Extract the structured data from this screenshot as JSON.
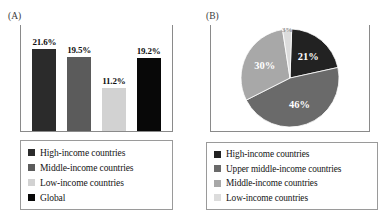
{
  "figure": {
    "panels": [
      {
        "tag": "(A)",
        "name": "bar-panel"
      },
      {
        "tag": "(B)",
        "name": "pie-panel"
      }
    ]
  },
  "chart_data": [
    {
      "type": "bar",
      "panel": "(A)",
      "title": "",
      "xlabel": "",
      "ylabel": "",
      "ylim": [
        0,
        25
      ],
      "grid": false,
      "legend_position": "below",
      "categories": [
        "High-income countries",
        "Middle-income countries",
        "Low-income countries",
        "Global"
      ],
      "values": [
        21.6,
        19.5,
        11.2,
        19.2
      ],
      "value_labels": [
        "21.6%",
        "19.5%",
        "11.2%",
        "19.2%"
      ],
      "colors": [
        "#2b2b2b",
        "#5b5b5b",
        "#d2d2d2",
        "#080808"
      ],
      "legend": [
        {
          "label": "High-income countries",
          "color": "#2b2b2b"
        },
        {
          "label": "Middle-income countries",
          "color": "#5b5b5b"
        },
        {
          "label": "Low-income countries",
          "color": "#d2d2d2"
        },
        {
          "label": "Global",
          "color": "#080808"
        }
      ]
    },
    {
      "type": "pie",
      "panel": "(B)",
      "title": "",
      "legend_position": "below",
      "categories": [
        "High-income countries",
        "Upper middle-income countries",
        "Middle-income countries",
        "Low-income countries"
      ],
      "values": [
        21,
        46,
        30,
        3
      ],
      "value_labels": [
        "21%",
        "46%",
        "30%",
        "3%"
      ],
      "colors": [
        "#222222",
        "#6a6a6a",
        "#a8a8a8",
        "#dcdcdc"
      ],
      "legend": [
        {
          "label": "High-income countries",
          "color": "#222222"
        },
        {
          "label": "Upper middle-income countries",
          "color": "#6a6a6a"
        },
        {
          "label": "Middle-income countries",
          "color": "#a8a8a8"
        },
        {
          "label": "Low-income countries",
          "color": "#dcdcdc"
        }
      ]
    }
  ]
}
